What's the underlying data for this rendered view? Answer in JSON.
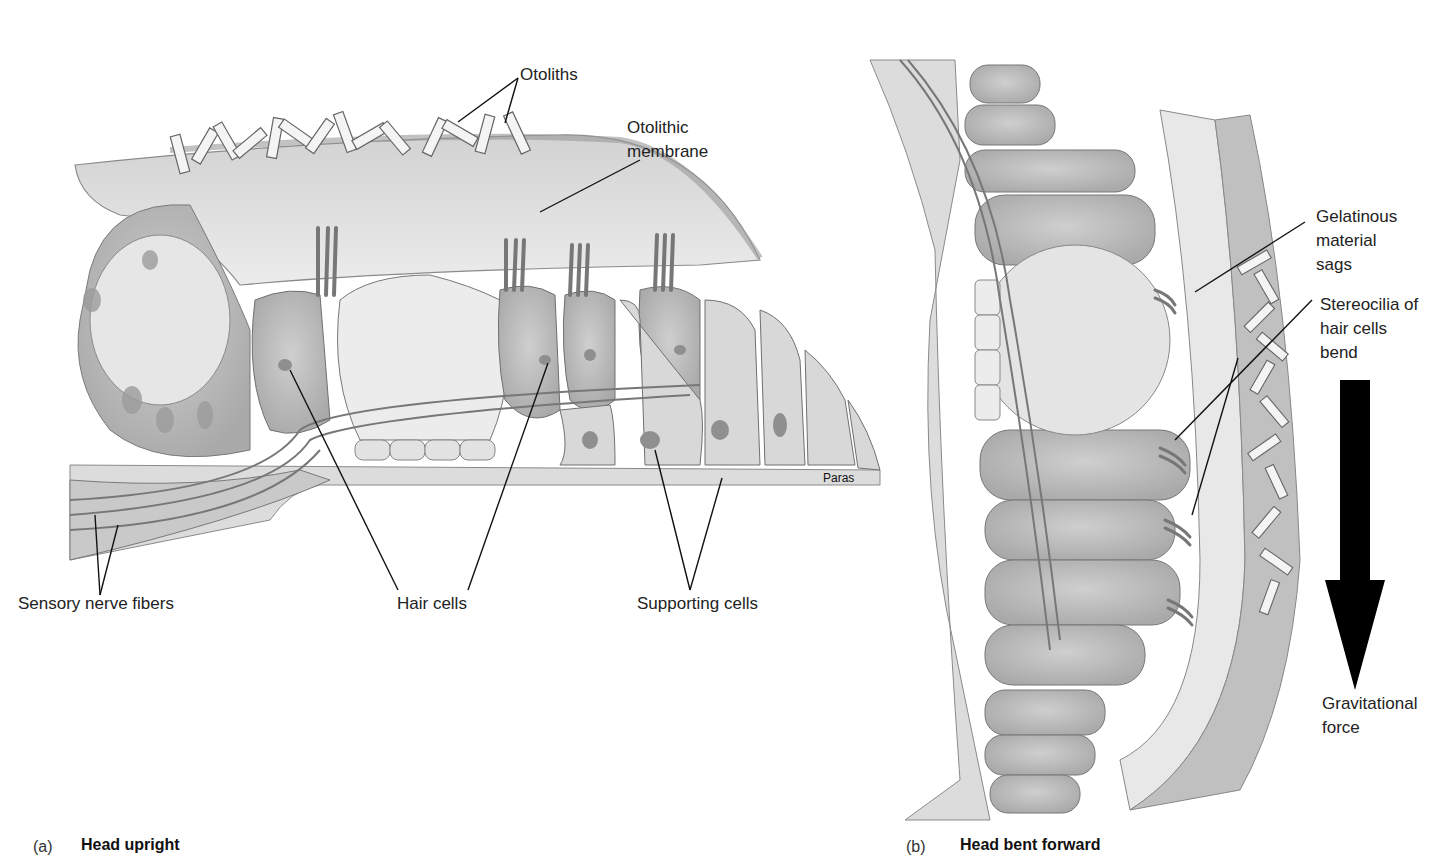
{
  "figure": {
    "panel_a": {
      "letter": "(a)",
      "title": "Head upright",
      "labels": {
        "otoliths": "Otoliths",
        "otolithic_membrane": "Otolithic\nmembrane",
        "sensory_nerve_fibers": "Sensory nerve fibers",
        "hair_cells": "Hair cells",
        "supporting_cells": "Supporting cells",
        "artist_signature": "Paras"
      }
    },
    "panel_b": {
      "letter": "(b)",
      "title": "Head bent forward",
      "labels": {
        "gelatinous_material": "Gelatinous\nmaterial\nsags",
        "stereocilia": "Stereocilia of\nhair cells\nbend",
        "gravitational_force": "Gravitational\nforce"
      }
    }
  },
  "colors": {
    "background": "#ffffff",
    "tissue_light": "#e4e4e4",
    "tissue_mid": "#c8c8c8",
    "tissue_dark": "#9a9a9a",
    "outline": "#6e6e6e",
    "leader_line": "#111111",
    "arrow": "#000000"
  }
}
